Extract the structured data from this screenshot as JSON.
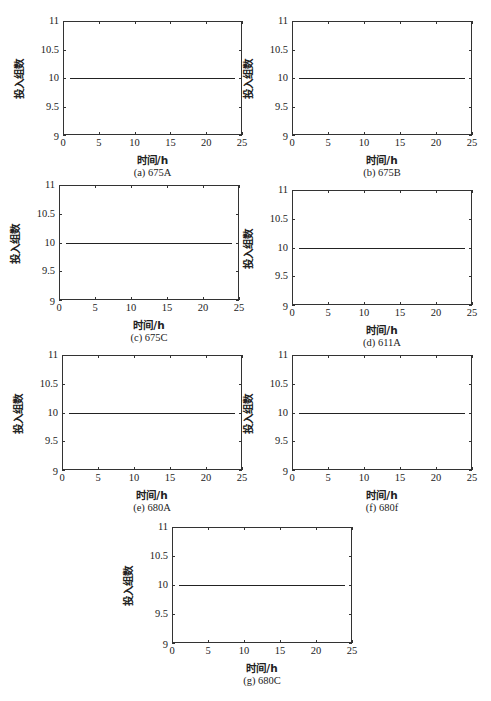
{
  "chart_data": [
    {
      "type": "line",
      "panel": "(a) 675A",
      "caption": "(a) 675A",
      "xlabel": "时间/h",
      "ylabel": "投入组数",
      "xlim": [
        0,
        25
      ],
      "ylim": [
        9,
        11
      ],
      "xticks": [
        0,
        5,
        10,
        15,
        20,
        25
      ],
      "yticks": [
        9,
        9.5,
        10,
        10.5,
        11
      ],
      "grid": false,
      "legend": null,
      "series": [
        {
          "name": "675A",
          "x": [
            1,
            24
          ],
          "y": [
            10,
            10
          ]
        }
      ]
    },
    {
      "type": "line",
      "panel": "(b) 675B",
      "caption": "(b) 675B",
      "xlabel": "时间/h",
      "ylabel": "投入组数",
      "xlim": [
        0,
        25
      ],
      "ylim": [
        9,
        11
      ],
      "xticks": [
        0,
        5,
        10,
        15,
        20,
        25
      ],
      "yticks": [
        9,
        9.5,
        10,
        10.5,
        11
      ],
      "grid": false,
      "legend": null,
      "series": [
        {
          "name": "675B",
          "x": [
            1,
            24
          ],
          "y": [
            10,
            10
          ]
        }
      ]
    },
    {
      "type": "line",
      "panel": "(c) 675C",
      "caption": "(c) 675C",
      "xlabel": "时间/h",
      "ylabel": "投入组数",
      "xlim": [
        0,
        25
      ],
      "ylim": [
        9,
        11
      ],
      "xticks": [
        0,
        5,
        10,
        15,
        20,
        25
      ],
      "yticks": [
        9,
        9.5,
        10,
        10.5,
        11
      ],
      "grid": false,
      "legend": null,
      "series": [
        {
          "name": "675C",
          "x": [
            1,
            24
          ],
          "y": [
            10,
            10
          ]
        }
      ]
    },
    {
      "type": "line",
      "panel": "(d) 611A",
      "caption": "(d) 611A",
      "xlabel": "时间/h",
      "ylabel": "投入组数",
      "xlim": [
        0,
        25
      ],
      "ylim": [
        9,
        11
      ],
      "xticks": [
        0,
        5,
        10,
        15,
        20,
        25
      ],
      "yticks": [
        9,
        9.5,
        10,
        10.5,
        11
      ],
      "grid": false,
      "legend": null,
      "series": [
        {
          "name": "611A",
          "x": [
            1,
            24
          ],
          "y": [
            10,
            10
          ]
        }
      ]
    },
    {
      "type": "line",
      "panel": "(e) 680A",
      "caption": "(e) 680A",
      "xlabel": "时间/h",
      "ylabel": "投入组数",
      "xlim": [
        0,
        25
      ],
      "ylim": [
        9,
        11
      ],
      "xticks": [
        0,
        5,
        10,
        15,
        20,
        25
      ],
      "yticks": [
        9,
        9.5,
        10,
        10.5,
        11
      ],
      "grid": false,
      "legend": null,
      "series": [
        {
          "name": "680A",
          "x": [
            1,
            24
          ],
          "y": [
            10,
            10
          ]
        }
      ]
    },
    {
      "type": "line",
      "panel": "(f) 680f",
      "caption": "(f) 680f",
      "xlabel": "时间/h",
      "ylabel": "投入组数",
      "xlim": [
        0,
        25
      ],
      "ylim": [
        9,
        11
      ],
      "xticks": [
        0,
        5,
        10,
        15,
        20,
        25
      ],
      "yticks": [
        9,
        9.5,
        10,
        10.5,
        11
      ],
      "grid": false,
      "legend": null,
      "series": [
        {
          "name": "680f",
          "x": [
            1,
            24
          ],
          "y": [
            10,
            10
          ]
        }
      ]
    },
    {
      "type": "line",
      "panel": "(g) 680C",
      "caption": "(g) 680C",
      "xlabel": "时间/h",
      "ylabel": "投入组数",
      "xlim": [
        0,
        25
      ],
      "ylim": [
        9,
        11
      ],
      "xticks": [
        0,
        5,
        10,
        15,
        20,
        25
      ],
      "yticks": [
        9,
        9.5,
        10,
        10.5,
        11
      ],
      "grid": false,
      "legend": null,
      "series": [
        {
          "name": "680C",
          "x": [
            1,
            24
          ],
          "y": [
            10,
            10
          ]
        }
      ]
    }
  ],
  "tick_labels": {
    "x": [
      "0",
      "5",
      "10",
      "15",
      "20",
      "25"
    ],
    "y": [
      "9",
      "9.5",
      "10",
      "10.5",
      "11"
    ]
  },
  "line_color": "#222222",
  "axis_color": "#333333"
}
